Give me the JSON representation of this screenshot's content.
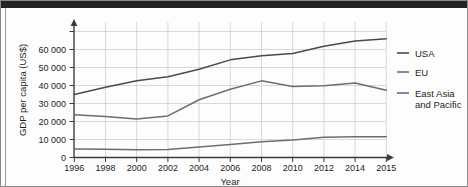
{
  "chart_data": {
    "type": "line",
    "title": "",
    "xlabel": "Year",
    "ylabel": "GDP per capita (US$)",
    "x": [
      1996,
      1998,
      2000,
      2002,
      2004,
      2006,
      2008,
      2010,
      2012,
      2014,
      2015
    ],
    "xtick_labels": [
      "1996",
      "1998",
      "2000",
      "2002",
      "2004",
      "2006",
      "2008",
      "2010",
      "2012",
      "2014",
      "2015"
    ],
    "ytick_labels": [
      "0",
      "10 000",
      "20 000",
      "30 000",
      "40 000",
      "50 000",
      "60 000"
    ],
    "ytick_values": [
      0,
      10000,
      20000,
      30000,
      40000,
      50000,
      60000
    ],
    "ylim": [
      0,
      65000
    ],
    "grid": "both",
    "legend_position": "right",
    "series": [
      {
        "name": "USA",
        "color": "#4a4a4a",
        "values": [
          30000,
          33500,
          36500,
          38500,
          42000,
          46500,
          48500,
          49500,
          53000,
          55500,
          56500
        ]
      },
      {
        "name": "EU",
        "color": "#6d6d6d",
        "values": [
          20400,
          19500,
          18300,
          19800,
          27500,
          32500,
          36500,
          33800,
          34200,
          35500,
          32000
        ]
      },
      {
        "name": "East Asia and Pacific",
        "color": "#6d6d6d",
        "values": [
          4000,
          3900,
          3700,
          3800,
          5000,
          6200,
          7500,
          8300,
          9700,
          9900,
          9900
        ]
      }
    ]
  },
  "legend": {
    "items": [
      {
        "label": "USA"
      },
      {
        "label": "EU"
      },
      {
        "label_line1": "East Asia",
        "label_line2": "and Pacific"
      }
    ]
  }
}
